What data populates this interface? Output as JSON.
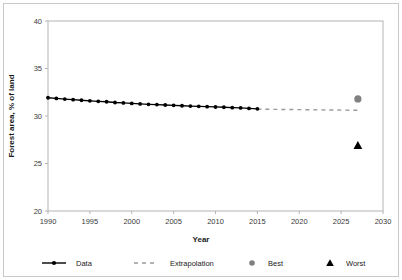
{
  "chart_data": {
    "type": "line",
    "title": "",
    "xlabel": "Year",
    "ylabel": "Forest area, % of land",
    "xlim": [
      1990,
      2030
    ],
    "ylim": [
      20,
      40
    ],
    "xticks": [
      1990,
      1995,
      2000,
      2005,
      2010,
      2015,
      2020,
      2025,
      2030
    ],
    "yticks": [
      20,
      25,
      30,
      35,
      40
    ],
    "grid": false,
    "legend_position": "bottom",
    "series": [
      {
        "name": "Data",
        "type": "line-markers",
        "color": "#000000",
        "x": [
          1990,
          1991,
          1992,
          1993,
          1994,
          1995,
          1996,
          1997,
          1998,
          1999,
          2000,
          2001,
          2002,
          2003,
          2004,
          2005,
          2006,
          2007,
          2008,
          2009,
          2010,
          2011,
          2012,
          2013,
          2014,
          2015
        ],
        "values": [
          31.92,
          31.85,
          31.78,
          31.72,
          31.66,
          31.6,
          31.55,
          31.5,
          31.42,
          31.38,
          31.32,
          31.27,
          31.23,
          31.2,
          31.16,
          31.12,
          31.08,
          31.05,
          31.02,
          30.98,
          30.95,
          30.92,
          30.88,
          30.85,
          30.8,
          30.76
        ]
      },
      {
        "name": "Extrapolation",
        "type": "dashed-line",
        "color": "#9a9a9a",
        "x": [
          2015,
          2027
        ],
        "values": [
          30.72,
          30.6
        ]
      },
      {
        "name": "Best",
        "type": "marker-circle",
        "color": "#808080",
        "x": [
          2027
        ],
        "values": [
          31.8
        ]
      },
      {
        "name": "Worst",
        "type": "marker-triangle",
        "color": "#000000",
        "x": [
          2027
        ],
        "values": [
          26.9
        ]
      }
    ],
    "legend": [
      {
        "label": "Data",
        "marker": "line-dot",
        "color": "#000000"
      },
      {
        "label": "Extrapolation",
        "marker": "dashed",
        "color": "#9a9a9a"
      },
      {
        "label": "Best",
        "marker": "circle",
        "color": "#808080"
      },
      {
        "label": "Worst",
        "marker": "triangle",
        "color": "#000000"
      }
    ]
  }
}
